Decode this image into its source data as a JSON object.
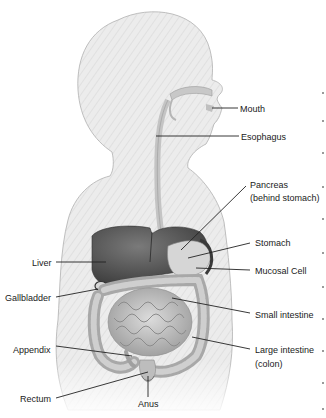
{
  "diagram": {
    "colors": {
      "body_fill": "#e9e9e9",
      "body_stroke": "#a8a8a8",
      "organ_dark": "#5c5c5c",
      "organ_mid": "#9a9a9a",
      "organ_light": "#cfcfcf",
      "leader_line": "#222222",
      "label_text": "#1a1a1a"
    },
    "labels": [
      {
        "id": "mouth",
        "text": "Mouth",
        "x": 240,
        "y": 104,
        "align": "left",
        "line": [
          212,
          108,
          238,
          108
        ]
      },
      {
        "id": "esophagus",
        "text": "Esophagus",
        "x": 241,
        "y": 132,
        "align": "left",
        "line": [
          156,
          136,
          239,
          136
        ]
      },
      {
        "id": "pancreas",
        "text": "Pancreas",
        "x": 250,
        "y": 180,
        "align": "left",
        "line": [
          181,
          250,
          246,
          186
        ]
      },
      {
        "id": "pancreas-sub",
        "text": "(behind stomach)",
        "x": 250,
        "y": 193,
        "align": "left",
        "line": null
      },
      {
        "id": "stomach",
        "text": "Stomach",
        "x": 255,
        "y": 238,
        "align": "left",
        "line": [
          188,
          258,
          250,
          243
        ]
      },
      {
        "id": "mucosal-cell",
        "text": "Mucosal Cell",
        "x": 255,
        "y": 266,
        "align": "left",
        "line": [
          196,
          268,
          250,
          270
        ]
      },
      {
        "id": "small-intestine",
        "text": "Small intestine",
        "x": 255,
        "y": 310,
        "align": "left",
        "line": [
          172,
          298,
          250,
          313
        ]
      },
      {
        "id": "large-intestine",
        "text": "Large intestine",
        "x": 255,
        "y": 345,
        "align": "left",
        "line": [
          192,
          337,
          250,
          349
        ]
      },
      {
        "id": "large-intestine-sub",
        "text": "(colon)",
        "x": 255,
        "y": 359,
        "align": "left",
        "line": null
      },
      {
        "id": "liver",
        "text": "Liver",
        "x": 32,
        "y": 258,
        "align": "left",
        "line": [
          56,
          262,
          106,
          262
        ]
      },
      {
        "id": "gallbladder",
        "text": "Gallbladder",
        "x": 5,
        "y": 293,
        "align": "left",
        "line": [
          56,
          297,
          98,
          289
        ]
      },
      {
        "id": "appendix",
        "text": "Appendix",
        "x": 13,
        "y": 345,
        "align": "left",
        "line": [
          56,
          346,
          132,
          356
        ]
      },
      {
        "id": "rectum",
        "text": "Rectum",
        "x": 20,
        "y": 394,
        "align": "left",
        "line": [
          56,
          398,
          148,
          372
        ]
      },
      {
        "id": "anus",
        "text": "Anus",
        "x": 138,
        "y": 399,
        "align": "left",
        "line": [
          148,
          376,
          148,
          397
        ]
      }
    ]
  }
}
